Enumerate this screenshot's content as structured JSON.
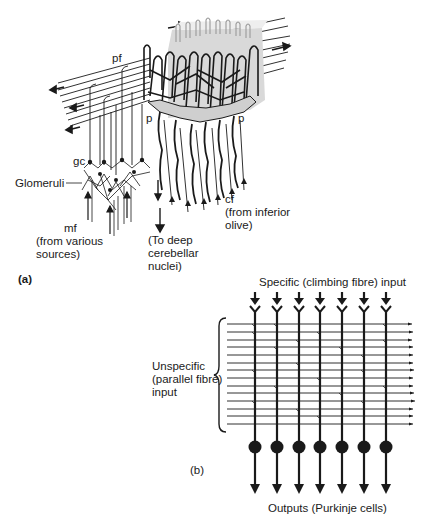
{
  "figure": {
    "panel_a": {
      "label": "(a)",
      "labels": {
        "pf": "pf",
        "p_left": "p",
        "p_right": "p",
        "gc": "gc",
        "glomeruli": "Glomeruli",
        "mf_line1": "mf",
        "mf_line2": "(from various",
        "mf_line3": "sources)",
        "deep_line1": "(To deep",
        "deep_line2": "cerebellar",
        "deep_line3": "nuclei)",
        "cf_line1": "cf",
        "cf_line2": "(from inferior",
        "cf_line3": "olive)"
      }
    },
    "panel_b": {
      "label": "(b)",
      "top_label": "Specific (climbing fibre) input",
      "left_label_line1": "Unspecific",
      "left_label_line2": "(parallel fibre)",
      "left_label_line3": "input",
      "bottom_label": "Outputs (Purkinje cells)",
      "purkinje_cell_count": 7,
      "parallel_fibre_count": 14
    },
    "colors": {
      "ink": "#1a1a1a",
      "shade": "#bdbdbd",
      "background": "#ffffff"
    }
  }
}
